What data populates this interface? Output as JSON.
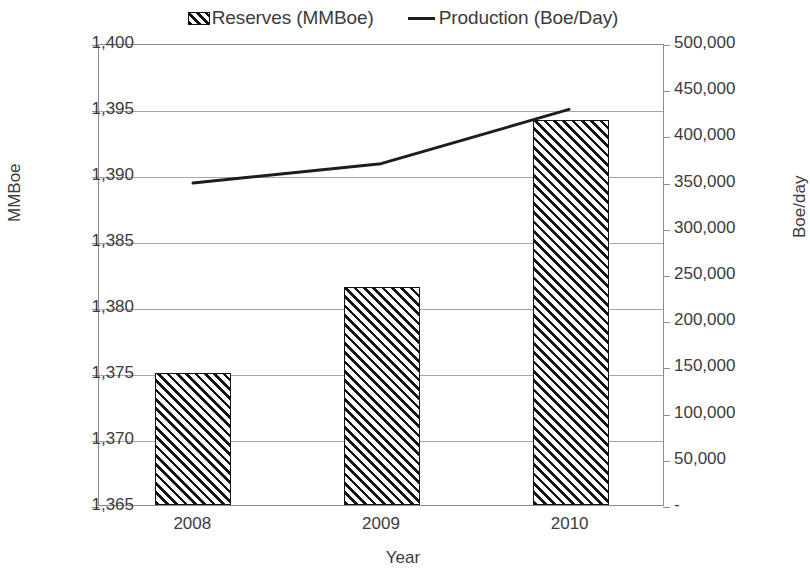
{
  "chart_data": {
    "type": "bar",
    "title": "",
    "categories": [
      "2008",
      "2009",
      "2010"
    ],
    "xlabel": "Year",
    "ylabel": "MMBoe",
    "y2label": "Boe/day",
    "ylim": [
      1365,
      1400
    ],
    "y2lim": [
      0,
      500000
    ],
    "grid": true,
    "legend_position": "top",
    "series": [
      {
        "name": "Reserves (MMBoe)",
        "type": "bar",
        "axis": "left",
        "pattern": "diagonal-hatch",
        "values": [
          1375,
          1381.5,
          1394.2
        ]
      },
      {
        "name": "Production (Boe/Day)",
        "type": "line",
        "axis": "right",
        "color": "#1d1d1d",
        "values": [
          350000,
          371000,
          430000
        ]
      }
    ],
    "left_ticks": [
      "1,365",
      "1,370",
      "1,375",
      "1,380",
      "1,385",
      "1,390",
      "1,395",
      "1,400"
    ],
    "left_tick_values": [
      1365,
      1370,
      1375,
      1380,
      1385,
      1390,
      1395,
      1400
    ],
    "right_ticks": [
      "-",
      "50,000",
      "100,000",
      "150,000",
      "200,000",
      "250,000",
      "300,000",
      "350,000",
      "400,000",
      "450,000",
      "500,000"
    ],
    "right_tick_values": [
      0,
      50000,
      100000,
      150000,
      200000,
      250000,
      300000,
      350000,
      400000,
      450000,
      500000
    ]
  },
  "legend": {
    "items": [
      {
        "label": "Reserves (MMBoe)",
        "marker": "hatch-swatch-icon"
      },
      {
        "label": "Production (Boe/Day)",
        "marker": "line-swatch-icon"
      }
    ]
  }
}
